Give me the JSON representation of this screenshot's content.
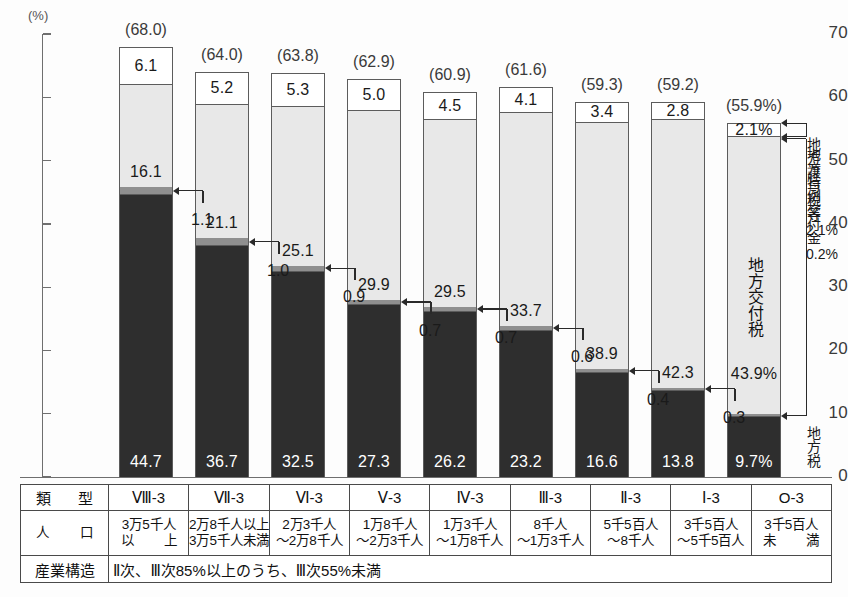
{
  "axis": {
    "unit_label": "(%)",
    "y_ticks": [
      0,
      10,
      20,
      30,
      40,
      50,
      60,
      70
    ],
    "y_min": 0,
    "y_max": 70
  },
  "legend": {
    "items": [
      {
        "name": "地方譲与税等",
        "value": "2.1%"
      },
      {
        "name": "地方特例交付金",
        "value": "0.2%"
      },
      {
        "name": "地方税",
        "value": ""
      }
    ],
    "inbar": {
      "alloc_name": "地方交付税",
      "alloc_value": "43.9%",
      "tax_value": "9.7%"
    }
  },
  "table": {
    "row_labels": {
      "type": [
        "類",
        "型"
      ],
      "population": [
        "人",
        "口"
      ],
      "industry": "産業構造"
    },
    "industry_text": "Ⅱ次、Ⅲ次85%以上のうち、Ⅲ次55%未満"
  },
  "chart_data": {
    "type": "bar",
    "title": "",
    "xlabel": "",
    "ylabel": "(%)",
    "ylim": [
      0,
      70
    ],
    "grid": false,
    "stacked": true,
    "legend_position": "right",
    "categories": [
      "Ⅷ-3",
      "Ⅶ-3",
      "Ⅵ-3",
      "Ⅴ-3",
      "Ⅳ-3",
      "Ⅲ-3",
      "Ⅱ-3",
      "Ⅰ-3",
      "O-3"
    ],
    "population": [
      [
        "3万5千人",
        "以        上"
      ],
      [
        "2万8千人以上",
        "3万5千人未満"
      ],
      [
        "2万3千人",
        "～2万8千人"
      ],
      [
        "1万8千人",
        "～2万3千人"
      ],
      [
        "1万3千人",
        "～1万8千人"
      ],
      [
        "8千人",
        "～1万3千人"
      ],
      [
        "5千5百人",
        "～8千人"
      ],
      [
        "3千5百人",
        "～5千5百人"
      ],
      [
        "3千5百人",
        "未        満"
      ]
    ],
    "series": [
      {
        "name": "地方税",
        "key": "tax",
        "color": "#2e2e2e",
        "values": [
          44.7,
          36.7,
          32.5,
          27.3,
          26.2,
          23.2,
          16.6,
          13.8,
          9.7
        ]
      },
      {
        "name": "地方特例交付金",
        "key": "spec",
        "color": "#8f8f8f",
        "values": [
          1.1,
          1.0,
          0.9,
          0.7,
          0.7,
          0.6,
          0.4,
          0.3,
          0.2
        ]
      },
      {
        "name": "地方交付税",
        "key": "alloc",
        "color": "#e8e8e8",
        "values": [
          16.1,
          21.1,
          25.1,
          29.9,
          29.5,
          33.7,
          38.9,
          42.3,
          43.9
        ]
      },
      {
        "name": "地方譲与税等",
        "key": "tran",
        "color": "#ffffff",
        "values": [
          6.1,
          5.2,
          5.3,
          5.0,
          4.5,
          4.1,
          3.4,
          2.8,
          2.1
        ]
      }
    ],
    "totals": [
      "(68.0)",
      "(64.0)",
      "(63.8)",
      "(62.9)",
      "(60.9)",
      "(61.6)",
      "(59.3)",
      "(59.2)",
      "(55.9%)"
    ],
    "tax_labels": [
      "44.7",
      "36.7",
      "32.5",
      "27.3",
      "26.2",
      "23.2",
      "16.6",
      "13.8",
      "9.7%"
    ],
    "spec_labels": [
      "1.1",
      "1.0",
      "0.9",
      "0.7",
      "0.7",
      "0.6",
      "0.4",
      "0.3",
      "0.2%"
    ],
    "alloc_labels": [
      "16.1",
      "21.1",
      "25.1",
      "29.9",
      "29.5",
      "33.7",
      "38.9",
      "42.3",
      "43.9%"
    ],
    "tran_labels": [
      "6.1",
      "5.2",
      "5.3",
      "5.0",
      "4.5",
      "4.1",
      "3.4",
      "2.8",
      "2.1%"
    ]
  }
}
